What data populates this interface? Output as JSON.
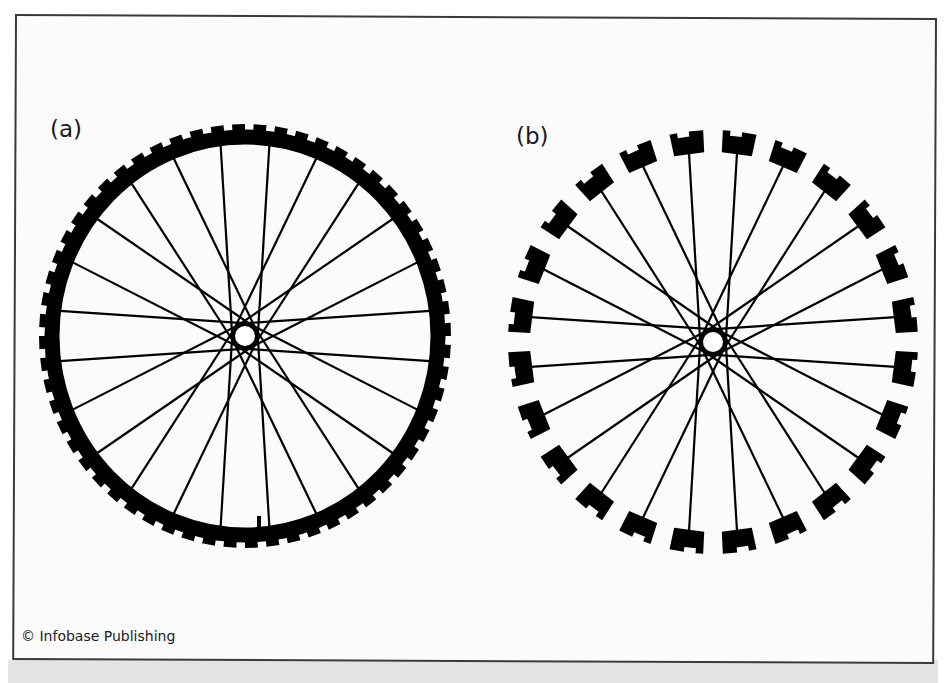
{
  "figure": {
    "panels": [
      {
        "label": "(a)",
        "description": "Bicycle wheel with continuous tire rim",
        "rim_type": "continuous",
        "center": [
          245,
          336
        ],
        "radius_x": 206,
        "radius_y": 212,
        "rim_thickness": 14,
        "tread_teeth": 60,
        "tread_height": 6,
        "spokes": 24,
        "hub_radius": 12,
        "valve_stem": true
      },
      {
        "label": "(b)",
        "description": "Bicycle wheel with rim broken into separate segments",
        "rim_type": "segmented",
        "center": [
          713,
          342
        ],
        "radius_x": 205,
        "radius_y": 212,
        "segment_count": 24,
        "segment_thickness": 22,
        "segment_arc_deg": 9.5,
        "spokes": 24,
        "hub_radius": 12
      }
    ],
    "colors": {
      "ink": "#000000",
      "frame_border": "#3a3a3a",
      "background": "#fbfbfb",
      "bottom_band": "#e3e3e3"
    }
  },
  "credit": "© Infobase Publishing"
}
